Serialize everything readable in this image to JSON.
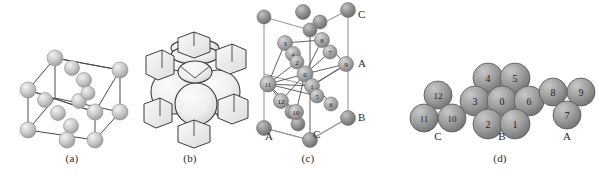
{
  "figure": {
    "panels": [
      {
        "id": "a",
        "label": "(a)",
        "caption_x": 72,
        "caption_y": 158
      },
      {
        "id": "b",
        "label": "(b)",
        "caption_x": 190,
        "caption_y": 158
      },
      {
        "id": "c",
        "label": "(c)",
        "caption_x": 308,
        "caption_y": 158
      },
      {
        "id": "d",
        "label": "(d)",
        "caption_x": 490,
        "caption_y": 158
      }
    ]
  },
  "panel_a": {
    "name": "fcc-unit-cell-wireframe",
    "sphere_color": "#bdbdbd",
    "sphere_highlight": "#e8e8e8",
    "edge_color": "#4a4a4a",
    "corner_spheres": [
      {
        "cx": 28,
        "cy": 90,
        "r": 8
      },
      {
        "cx": 28,
        "cy": 130,
        "r": 8
      },
      {
        "cx": 95,
        "cy": 112,
        "r": 8
      },
      {
        "cx": 95,
        "cy": 140,
        "r": 8
      },
      {
        "cx": 55,
        "cy": 58,
        "r": 8
      },
      {
        "cx": 120,
        "cy": 70,
        "r": 8
      },
      {
        "cx": 120,
        "cy": 112,
        "r": 8
      },
      {
        "cx": 80,
        "cy": 138,
        "r": 8
      }
    ],
    "face_spheres": [
      {
        "cx": 72,
        "cy": 68,
        "r": 7
      },
      {
        "cx": 82,
        "cy": 78,
        "r": 7
      },
      {
        "cx": 45,
        "cy": 100,
        "r": 7
      },
      {
        "cx": 78,
        "cy": 100,
        "r": 7
      },
      {
        "cx": 56,
        "cy": 112,
        "r": 7
      },
      {
        "cx": 96,
        "cy": 94,
        "r": 7
      },
      {
        "cx": 72,
        "cy": 125,
        "r": 7
      }
    ]
  },
  "panel_b": {
    "name": "space-filling-truncated-cell",
    "fill_color": "#f1f1f1",
    "shade_color": "#9a9a9a",
    "outline_color": "#3c3c3c",
    "big_spheres": [
      {
        "cx": 175,
        "cy": 62,
        "rx": 22,
        "ry": 9
      },
      {
        "cx": 172,
        "cy": 98,
        "rx": 24,
        "ry": 26
      },
      {
        "cx": 212,
        "cy": 98,
        "rx": 22,
        "ry": 25
      },
      {
        "cx": 192,
        "cy": 118,
        "rx": 20,
        "ry": 22
      }
    ],
    "corner_cubes": [
      {
        "x": 152,
        "y": 56
      },
      {
        "x": 222,
        "y": 56
      },
      {
        "x": 148,
        "y": 112
      },
      {
        "x": 226,
        "y": 110
      },
      {
        "x": 186,
        "y": 130
      }
    ]
  },
  "panel_c": {
    "name": "coordination-polyhedron-cell",
    "edge_color": "#8a8a8a",
    "bond_color": "#3a3a3a",
    "corner_color": "#8e8e8e",
    "inner_color": "#a6a6a6",
    "stack_labels": [
      {
        "text": "C",
        "x": 355,
        "y": 14
      },
      {
        "text": "A",
        "x": 355,
        "y": 56
      },
      {
        "text": "B",
        "x": 355,
        "y": 117
      },
      {
        "text": "A",
        "x": 275,
        "y": 140
      },
      {
        "text": "C",
        "x": 330,
        "y": 140
      }
    ],
    "numbered_spheres": [
      {
        "n": "0",
        "cx": 305,
        "cy": 74
      },
      {
        "n": "1",
        "cx": 312,
        "cy": 86
      },
      {
        "n": "2",
        "cx": 293,
        "cy": 54
      },
      {
        "n": "3",
        "cx": 285,
        "cy": 43
      },
      {
        "n": "4",
        "cx": 297,
        "cy": 62
      },
      {
        "n": "5",
        "cx": 317,
        "cy": 96
      },
      {
        "n": "6",
        "cx": 331,
        "cy": 104
      },
      {
        "n": "7",
        "cx": 330,
        "cy": 52
      },
      {
        "n": "8",
        "cx": 322,
        "cy": 40
      },
      {
        "n": "9",
        "cx": 346,
        "cy": 64
      },
      {
        "n": "10",
        "cx": 296,
        "cy": 112
      },
      {
        "n": "11",
        "cx": 268,
        "cy": 84
      },
      {
        "n": "12",
        "cx": 281,
        "cy": 101
      }
    ],
    "corner_spheres": [
      {
        "cx": 262,
        "cy": 17
      },
      {
        "cx": 303,
        "cy": 12
      },
      {
        "cx": 348,
        "cy": 10
      },
      {
        "cx": 262,
        "cy": 74
      },
      {
        "cx": 346,
        "cy": 64
      },
      {
        "cx": 262,
        "cy": 128
      },
      {
        "cx": 303,
        "cy": 125
      },
      {
        "cx": 348,
        "cy": 118
      },
      {
        "cx": 303,
        "cy": 30
      },
      {
        "cx": 322,
        "cy": 22
      }
    ]
  },
  "panel_d": {
    "name": "close-packed-layer-clusters",
    "sphere_color": "#9c9c9c",
    "sphere_edge": "#555555",
    "number_color": "#1e1e1e",
    "clusters": [
      {
        "label": "C",
        "label_x": 415,
        "label_y": 137,
        "spheres": [
          {
            "n": "12",
            "cx": 438,
            "cy": 95,
            "r": 14
          },
          {
            "n": "11",
            "cx": 424,
            "cy": 118,
            "r": 14
          },
          {
            "n": "10",
            "cx": 452,
            "cy": 118,
            "r": 14
          }
        ]
      },
      {
        "label": "B",
        "label_x": 480,
        "label_y": 137,
        "spheres": [
          {
            "n": "4",
            "cx": 488,
            "cy": 78,
            "r": 15
          },
          {
            "n": "5",
            "cx": 515,
            "cy": 78,
            "r": 15
          },
          {
            "n": "3",
            "cx": 475,
            "cy": 101,
            "r": 15
          },
          {
            "n": "0",
            "cx": 502,
            "cy": 101,
            "r": 15
          },
          {
            "n": "6",
            "cx": 529,
            "cy": 101,
            "r": 15
          },
          {
            "n": "2",
            "cx": 488,
            "cy": 124,
            "r": 15
          },
          {
            "n": "1",
            "cx": 515,
            "cy": 124,
            "r": 15
          }
        ]
      },
      {
        "label": "A",
        "label_x": 546,
        "label_y": 137,
        "spheres": [
          {
            "n": "8",
            "cx": 553,
            "cy": 92,
            "r": 14
          },
          {
            "n": "9",
            "cx": 581,
            "cy": 92,
            "r": 14
          },
          {
            "n": "7",
            "cx": 567,
            "cy": 115,
            "r": 14
          }
        ]
      }
    ]
  }
}
